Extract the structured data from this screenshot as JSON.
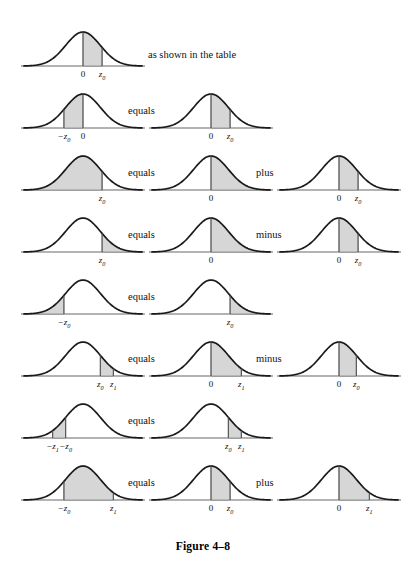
{
  "figure": {
    "caption": "Figure 4–8",
    "note": "as shown in the table",
    "words": {
      "equals": "equals",
      "plus": "plus",
      "minus": "minus"
    },
    "colors": {
      "curve_stroke": "#1a1a1a",
      "axis_stroke": "#9a9a9a",
      "shade_fill": "#d6d6d6",
      "shade_stroke": "#6e6e6e",
      "center_line": "#555555",
      "text": "#111111",
      "background": "#ffffff"
    }
  },
  "chart_data": {
    "type": "area",
    "title": "Figure 4–8",
    "distribution": "standard normal",
    "xlabel": "",
    "ylabel": "",
    "xlim": [
      -3.4,
      3.4
    ],
    "grid": false,
    "legend": null,
    "rows": [
      {
        "id": "row-1",
        "panels": [
          {
            "id": "r1c1",
            "shade_from": 0.0,
            "shade_to": 1.1,
            "ticks": [
              {
                "value": 0.0,
                "label": "0",
                "italic": false
              },
              {
                "value": 1.1,
                "label": "z",
                "sub": "0",
                "italic": true
              }
            ],
            "verticals": [
              0.0,
              1.1
            ]
          }
        ],
        "operators": [],
        "note": "as shown in the table"
      },
      {
        "id": "row-2",
        "panels": [
          {
            "id": "r2c1",
            "shade_from": -1.1,
            "shade_to": 0.0,
            "ticks": [
              {
                "value": -1.1,
                "label": "−z",
                "sub": "0",
                "italic": true
              },
              {
                "value": 0.0,
                "label": "0",
                "italic": false
              }
            ],
            "verticals": [
              -1.1,
              0.0
            ]
          },
          {
            "id": "r2c2",
            "shade_from": 0.0,
            "shade_to": 1.1,
            "ticks": [
              {
                "value": 0.0,
                "label": "0",
                "italic": false
              },
              {
                "value": 1.1,
                "label": "z",
                "sub": "0",
                "italic": true
              }
            ],
            "verticals": [
              0.0,
              1.1
            ]
          }
        ],
        "operators": [
          "equals"
        ]
      },
      {
        "id": "row-3",
        "panels": [
          {
            "id": "r3c1",
            "shade_from": -3.4,
            "shade_to": 1.1,
            "ticks": [
              {
                "value": 1.1,
                "label": "z",
                "sub": "0",
                "italic": true
              }
            ],
            "verticals": [
              1.1
            ]
          },
          {
            "id": "r3c2",
            "shade_from": 0.0,
            "shade_to": 3.4,
            "ticks": [
              {
                "value": 0.0,
                "label": "0",
                "italic": false
              }
            ],
            "verticals": [
              0.0
            ]
          },
          {
            "id": "r3c3",
            "shade_from": 0.0,
            "shade_to": 1.1,
            "ticks": [
              {
                "value": 0.0,
                "label": "0",
                "italic": false
              },
              {
                "value": 1.1,
                "label": "z",
                "sub": "0",
                "italic": true
              }
            ],
            "verticals": [
              0.0,
              1.1
            ]
          }
        ],
        "operators": [
          "equals",
          "plus"
        ]
      },
      {
        "id": "row-4",
        "panels": [
          {
            "id": "r4c1",
            "shade_from": 1.1,
            "shade_to": 3.4,
            "ticks": [
              {
                "value": 1.1,
                "label": "z",
                "sub": "0",
                "italic": true
              }
            ],
            "verticals": [
              1.1
            ]
          },
          {
            "id": "r4c2",
            "shade_from": 0.0,
            "shade_to": 3.4,
            "ticks": [
              {
                "value": 0.0,
                "label": "0",
                "italic": false
              }
            ],
            "verticals": [
              0.0
            ]
          },
          {
            "id": "r4c3",
            "shade_from": 0.0,
            "shade_to": 1.1,
            "ticks": [
              {
                "value": 0.0,
                "label": "0",
                "italic": false
              },
              {
                "value": 1.1,
                "label": "z",
                "sub": "0",
                "italic": true
              }
            ],
            "verticals": [
              0.0,
              1.1
            ]
          }
        ],
        "operators": [
          "equals",
          "minus"
        ]
      },
      {
        "id": "row-5",
        "panels": [
          {
            "id": "r5c1",
            "shade_from": -3.4,
            "shade_to": -1.1,
            "ticks": [
              {
                "value": -1.1,
                "label": "−z",
                "sub": "0",
                "italic": true
              }
            ],
            "verticals": [
              -1.1
            ]
          },
          {
            "id": "r5c2",
            "shade_from": 1.1,
            "shade_to": 3.4,
            "ticks": [
              {
                "value": 1.1,
                "label": "z",
                "sub": "0",
                "italic": true
              }
            ],
            "verticals": [
              1.1
            ]
          }
        ],
        "operators": [
          "equals"
        ]
      },
      {
        "id": "row-6",
        "panels": [
          {
            "id": "r6c1",
            "shade_from": 1.0,
            "shade_to": 1.75,
            "ticks": [
              {
                "value": 1.0,
                "label": "z",
                "sub": "0",
                "italic": true
              },
              {
                "value": 1.75,
                "label": "z",
                "sub": "1",
                "italic": true
              }
            ],
            "verticals": [
              1.0,
              1.75
            ]
          },
          {
            "id": "r6c2",
            "shade_from": 0.0,
            "shade_to": 1.75,
            "ticks": [
              {
                "value": 0.0,
                "label": "0",
                "italic": false
              },
              {
                "value": 1.75,
                "label": "z",
                "sub": "1",
                "italic": true
              }
            ],
            "verticals": [
              0.0,
              1.75
            ]
          },
          {
            "id": "r6c3",
            "shade_from": 0.0,
            "shade_to": 1.0,
            "ticks": [
              {
                "value": 0.0,
                "label": "0",
                "italic": false
              },
              {
                "value": 1.0,
                "label": "z",
                "sub": "0",
                "italic": true
              }
            ],
            "verticals": [
              0.0,
              1.0
            ]
          }
        ],
        "operators": [
          "equals",
          "minus"
        ]
      },
      {
        "id": "row-7",
        "panels": [
          {
            "id": "r7c1",
            "shade_from": -1.75,
            "shade_to": -1.0,
            "ticks": [
              {
                "value": -1.75,
                "label": "−z",
                "sub": "1",
                "italic": true
              },
              {
                "value": -1.0,
                "label": "−z",
                "sub": "0",
                "italic": true
              }
            ],
            "verticals": [
              -1.75,
              -1.0
            ]
          },
          {
            "id": "r7c2",
            "shade_from": 1.0,
            "shade_to": 1.75,
            "ticks": [
              {
                "value": 1.0,
                "label": "z",
                "sub": "0",
                "italic": true
              },
              {
                "value": 1.75,
                "label": "z",
                "sub": "1",
                "italic": true
              }
            ],
            "verticals": [
              1.0,
              1.75
            ]
          }
        ],
        "operators": [
          "equals"
        ]
      },
      {
        "id": "row-8",
        "panels": [
          {
            "id": "r8c1",
            "shade_from": -1.1,
            "shade_to": 1.75,
            "ticks": [
              {
                "value": -1.1,
                "label": "−z",
                "sub": "0",
                "italic": true
              },
              {
                "value": 1.75,
                "label": "z",
                "sub": "1",
                "italic": true
              }
            ],
            "verticals": [
              -1.1,
              1.75
            ]
          },
          {
            "id": "r8c2",
            "shade_from": 0.0,
            "shade_to": 1.1,
            "ticks": [
              {
                "value": 0.0,
                "label": "0",
                "italic": false
              },
              {
                "value": 1.1,
                "label": "z",
                "sub": "0",
                "italic": true
              }
            ],
            "verticals": [
              0.0,
              1.1
            ]
          },
          {
            "id": "r8c3",
            "shade_from": 0.0,
            "shade_to": 1.75,
            "ticks": [
              {
                "value": 0.0,
                "label": "0",
                "italic": false
              },
              {
                "value": 1.75,
                "label": "z",
                "sub": "1",
                "italic": true
              }
            ],
            "verticals": [
              0.0,
              1.75
            ]
          }
        ],
        "operators": [
          "equals",
          "plus"
        ]
      }
    ]
  },
  "layout": {
    "row_tops": [
      22,
      84,
      146,
      208,
      270,
      332,
      394,
      456
    ],
    "column_lefts": [
      20,
      148,
      276
    ],
    "operator_lefts": [
      128,
      256
    ],
    "note_left": 148,
    "note_top": 28,
    "caption_top": 540
  }
}
